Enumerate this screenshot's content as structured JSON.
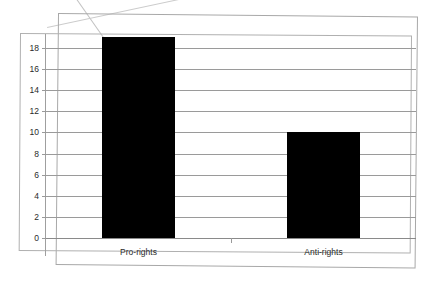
{
  "chart_data": {
    "type": "bar",
    "title": "",
    "subtitle": "",
    "xlabel": "",
    "ylabel": "",
    "categories": [
      "Pro-rights",
      "Anti-rights"
    ],
    "values": [
      19,
      10
    ],
    "series": [
      {
        "name": "",
        "values": [
          19,
          10
        ]
      }
    ],
    "ylim": [
      0,
      20
    ],
    "ytick_labels": [
      "0",
      "2",
      "4",
      "6",
      "8",
      "10",
      "12",
      "14",
      "16",
      "18"
    ],
    "ytick_values": [
      0,
      2,
      4,
      6,
      8,
      10,
      12,
      14,
      16,
      18
    ],
    "ytick_interval": 2,
    "grid": true,
    "grid_axis": "y",
    "legend": false,
    "legend_position": "none",
    "bar_color": "#000000",
    "grid_color": "#9a9a9a",
    "axis_color": "#9a9a9a",
    "background_color": "#ffffff",
    "annotations": []
  },
  "figure": {
    "frame_border_color": "#a8a8a8",
    "plot_border_color": "#b0b0b0",
    "artifacts": [
      "scan-fold-crease-top-left",
      "tilted-page-border"
    ]
  }
}
